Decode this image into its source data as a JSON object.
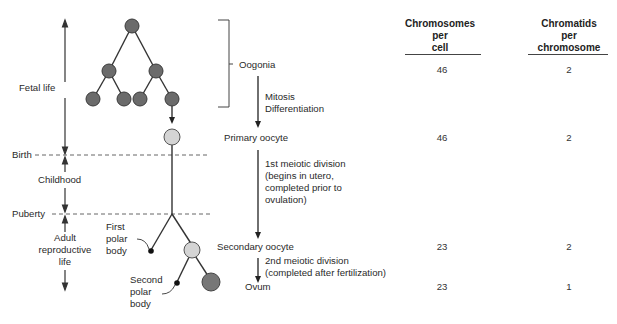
{
  "timeline": {
    "stages": [
      {
        "label": "Fetal life"
      },
      {
        "label": "Childhood"
      },
      {
        "label": "Adult\nreproductive\nlife"
      }
    ],
    "markers": [
      {
        "label": "Birth"
      },
      {
        "label": "Puberty"
      }
    ]
  },
  "cell_labels": {
    "first_polar_body": "First\npolar\nbody",
    "second_polar_body": "Second\npolar\nbody"
  },
  "stages": [
    {
      "name": "Oogonia",
      "chromosomes_per_cell": "46",
      "chromatids_per_chromosome": "2"
    },
    {
      "name": "Primary oocyte",
      "chromosomes_per_cell": "46",
      "chromatids_per_chromosome": "2"
    },
    {
      "name": "Secondary oocyte",
      "chromosomes_per_cell": "23",
      "chromatids_per_chromosome": "2"
    },
    {
      "name": "Ovum",
      "chromosomes_per_cell": "23",
      "chromatids_per_chromosome": "1"
    }
  ],
  "transitions": [
    {
      "label": "Mitosis\nDifferentiation"
    },
    {
      "label": "1st meiotic division\n(begins in utero,\ncompleted prior to\novulation)"
    },
    {
      "label": "2nd meiotic division\n(completed after fertilization)"
    }
  ],
  "table": {
    "headers": [
      "Chromosomes\nper\ncell",
      "Chromatids\nper\nchromosome"
    ]
  },
  "colors": {
    "oogonia_fill": "#6b6b6b",
    "primary_oocyte_fill": "#d4d4d4",
    "ovum_fill": "#777777",
    "polar_body_fill": "#111111",
    "line": "#333333"
  }
}
